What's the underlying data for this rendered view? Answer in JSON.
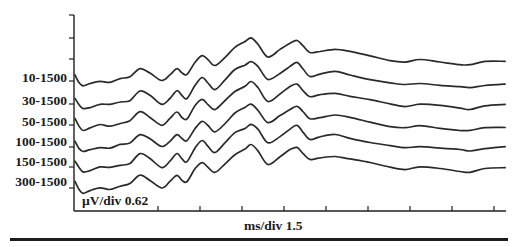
{
  "chart_data": {
    "type": "line",
    "title": "",
    "xlabel": "ms/div 1.5",
    "ylabel": "µV/div 0.62",
    "x_scale": {
      "label": "ms/div",
      "value": 1.5
    },
    "y_scale": {
      "label": "µV/div",
      "value": 0.62
    },
    "grid": false,
    "legend": "series labels on left of y-axis",
    "x_divisions": 10,
    "y_ticks_above_traces": 3,
    "series_offset_px": [
      0,
      23,
      44,
      66,
      86,
      107
    ],
    "series": [
      {
        "name": "10-1500",
        "color": "#2a2a2a"
      },
      {
        "name": "30-1500",
        "color": "#2a2a2a"
      },
      {
        "name": "50-1500",
        "color": "#2a2a2a"
      },
      {
        "name": "100-1500",
        "color": "#2a2a2a"
      },
      {
        "name": "150-1500",
        "color": "#2a2a2a"
      },
      {
        "name": "300-1500",
        "color": "#2a2a2a"
      }
    ],
    "waveform_x_ms": [
      0,
      0.14,
      0.29,
      0.54,
      0.89,
      1.25,
      1.61,
      1.96,
      2.32,
      2.68,
      3.1,
      3.39,
      3.64,
      3.82,
      4.0,
      4.29,
      4.54,
      4.75,
      5.0,
      5.36,
      5.71,
      6.07,
      6.29,
      6.54,
      6.89,
      7.32,
      7.68,
      7.93,
      8.14,
      8.39,
      8.75,
      9.29,
      9.82,
      10.54,
      11.25,
      11.79,
      12.32,
      13.04,
      13.75,
      14.11,
      14.64,
      15.36
    ],
    "waveform_y_div": [
      0.0,
      -0.33,
      -0.52,
      -0.43,
      -0.29,
      -0.33,
      -0.19,
      -0.1,
      0.33,
      0.1,
      -0.29,
      0.0,
      0.33,
      0.1,
      0.0,
      0.62,
      0.95,
      0.71,
      0.43,
      0.86,
      1.33,
      1.57,
      1.76,
      1.48,
      0.86,
      1.19,
      1.52,
      1.67,
      1.38,
      1.05,
      1.14,
      1.24,
      1.1,
      0.9,
      0.71,
      0.62,
      0.71,
      0.62,
      0.52,
      0.48,
      0.62,
      0.67
    ]
  },
  "labels": {
    "series": [
      "10-1500",
      "30-1500",
      "50-1500",
      "100-1500",
      "150-1500",
      "300-1500"
    ],
    "y_scale": "µV/div 0.62",
    "x_scale": "ms/div 1.5"
  }
}
